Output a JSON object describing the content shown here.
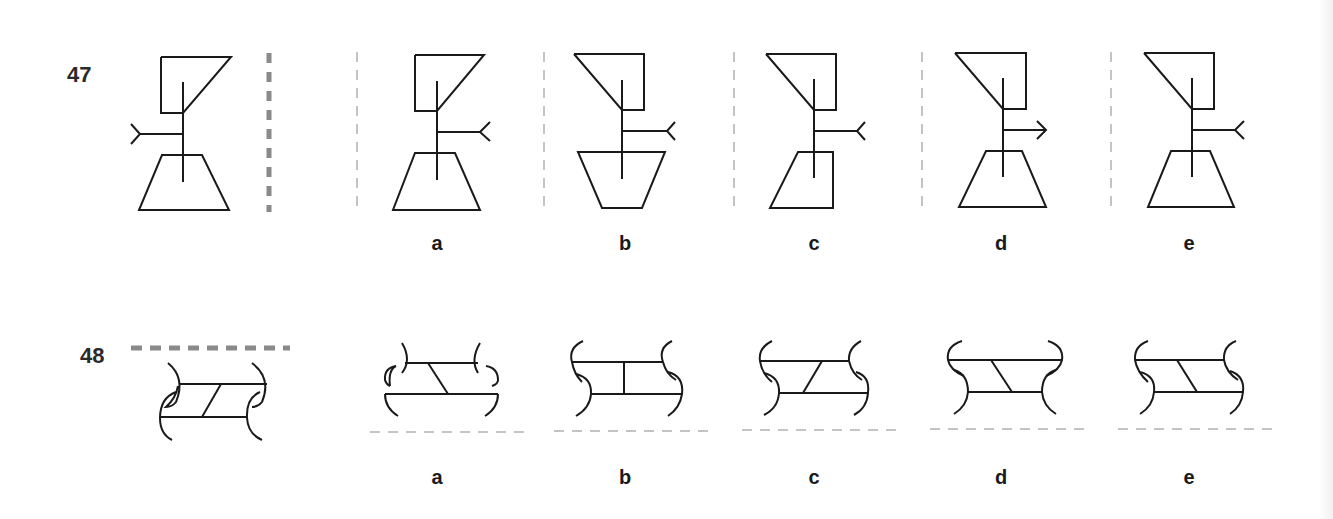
{
  "questions": [
    {
      "number": "47",
      "mirror_line": "vertical, right of figure (thick dashed grey)",
      "question_figure": "trapezoid-topped flag and trapezoid base on vertical stem, arrow-tail branch pointing left",
      "options": [
        {
          "label": "a",
          "description": "flag same as original, branch with fork pointing right, base trapezoid upright"
        },
        {
          "label": "b",
          "description": "flag mirrored, branch fork right, base trapezoid inverted"
        },
        {
          "label": "c",
          "description": "flag mirrored, branch fork right, base is right trapezoid"
        },
        {
          "label": "d",
          "description": "flag mirrored, branch ends with arrowhead right, base trapezoid upright"
        },
        {
          "label": "e",
          "description": "flag mirrored, branch fork right, base trapezoid upright"
        }
      ]
    },
    {
      "number": "48",
      "mirror_line": "horizontal, above figure (thick dashed grey)",
      "question_figure": "two horizontal bars joined by slanted rung, curved brackets at ends",
      "options": [
        {
          "label": "a",
          "description": "reflected variant a"
        },
        {
          "label": "b",
          "description": "variant with vertical rung"
        },
        {
          "label": "c",
          "description": "variant with forward-slanted rung"
        },
        {
          "label": "d",
          "description": "variant with wide top bar"
        },
        {
          "label": "e",
          "description": "variant with back-slanted rung"
        }
      ]
    }
  ],
  "colors": {
    "ink": "#1a1a1a",
    "mirror_line": "#8a8a8a",
    "separator": "#c4c4c4"
  }
}
